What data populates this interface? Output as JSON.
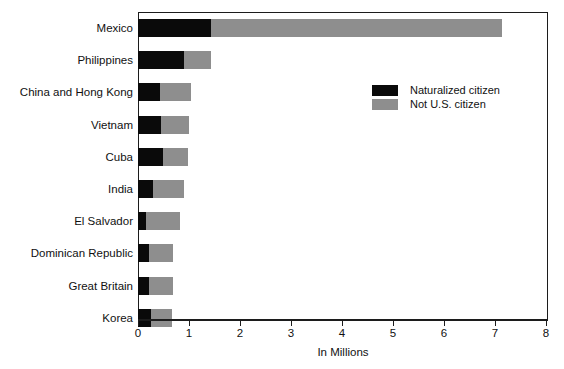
{
  "chart_data": {
    "type": "bar",
    "orientation": "horizontal",
    "stacked": true,
    "title": "",
    "xlabel": "In Millions",
    "ylabel": "",
    "xlim": [
      0,
      8
    ],
    "xticks": [
      "0",
      "1",
      "2",
      "3",
      "4",
      "5",
      "6",
      "7",
      "8"
    ],
    "grid": false,
    "legend_position": "upper right inside plot",
    "categories": [
      "Mexico",
      "Philippines",
      "China and Hong Kong",
      "Vietnam",
      "Cuba",
      "India",
      "El Salvador",
      "Dominican Republic",
      "Great Britain",
      "Korea"
    ],
    "series": [
      {
        "name": "Naturalized citizen",
        "color": "#0a0a0a",
        "values": [
          1.43,
          0.9,
          0.44,
          0.45,
          0.49,
          0.3,
          0.15,
          0.21,
          0.22,
          0.25
        ]
      },
      {
        "name": "Not U.S. citizen",
        "color": "#8e8e8e",
        "values": [
          5.71,
          0.53,
          0.6,
          0.55,
          0.49,
          0.6,
          0.67,
          0.48,
          0.46,
          0.41
        ]
      }
    ],
    "totals": [
      7.14,
      1.43,
      1.04,
      1.0,
      0.98,
      0.9,
      0.82,
      0.69,
      0.68,
      0.66
    ]
  },
  "legend": {
    "items": [
      {
        "label": "Naturalized citizen",
        "swatch": "black"
      },
      {
        "label": "Not U.S. citizen",
        "swatch": "gray"
      }
    ]
  },
  "caption": {
    "text": ""
  }
}
